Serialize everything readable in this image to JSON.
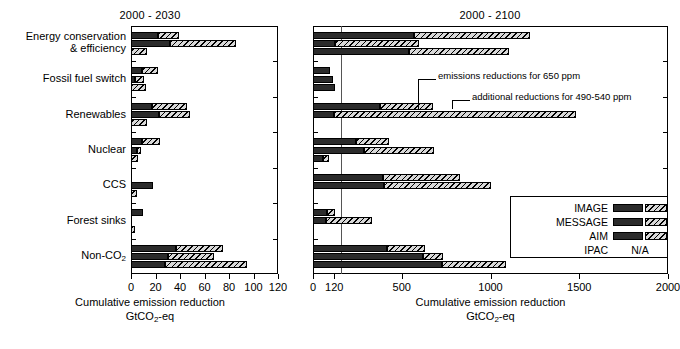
{
  "chart_data": {
    "type": "bar",
    "orientation": "horizontal",
    "title": "",
    "categories": [
      "Energy conservation & efficiency",
      "Fossil fuel switch",
      "Renewables",
      "Nuclear",
      "CCS",
      "Forest sinks",
      "Non-CO2"
    ],
    "legend_entries": [
      "IMAGE",
      "MESSAGE",
      "AIM",
      "IPAC"
    ],
    "legend_position": "bottom-right of right panel",
    "legend_na_text": "N/A",
    "segment_meaning": {
      "solid": "emissions reductions for 650 ppm",
      "hatched": "additional reductions for 490-540 ppm"
    },
    "xlabel": "Cumulative emission reduction GtCO2-eq",
    "ylabel": "",
    "grid": false,
    "panels": [
      {
        "title": "2000 - 2030",
        "xlim": [
          0,
          120
        ],
        "xticks": [
          0,
          20,
          40,
          60,
          80,
          100,
          120
        ],
        "reference_line": null,
        "series": [
          {
            "name": "IMAGE",
            "base": [
              22,
              9,
              17,
              9,
              0,
              10,
              37
            ],
            "additional": [
              [
                22,
                39
              ],
              [
                9,
                22
              ],
              [
                17,
                46
              ],
              [
                9,
                24
              ],
              [
                0,
                0
              ],
              [
                10,
                10
              ],
              [
                37,
                75
              ]
            ]
          },
          {
            "name": "MESSAGE",
            "base": [
              32,
              3,
              23,
              5,
              18,
              0,
              30
            ],
            "additional": [
              [
                32,
                86
              ],
              [
                3,
                11
              ],
              [
                23,
                48
              ],
              [
                5,
                8
              ],
              [
                18,
                18
              ],
              [
                0,
                0
              ],
              [
                30,
                68
              ]
            ]
          },
          {
            "name": "AIM",
            "base": [
              0,
              0,
              0,
              0,
              0,
              0,
              28
            ],
            "additional": [
              [
                0,
                13
              ],
              [
                0,
                12
              ],
              [
                0,
                13
              ],
              [
                0,
                6
              ],
              [
                0,
                5
              ],
              [
                0,
                3
              ],
              [
                28,
                95
              ]
            ]
          }
        ]
      },
      {
        "title": "2000 - 2100",
        "xlim": [
          0,
          2000
        ],
        "xticks": [
          0,
          120,
          500,
          1000,
          1500,
          2000
        ],
        "reference_line": 120,
        "series": [
          {
            "name": "IMAGE",
            "base": [
              570,
              95,
              380,
              245,
              395,
              80,
              415
            ],
            "additional": [
              [
                570,
                1225
              ],
              [
                95,
                95
              ],
              [
                380,
                675
              ],
              [
                245,
                430
              ],
              [
                395,
                830
              ],
              [
                80,
                125
              ],
              [
                415,
                630
              ]
            ]
          },
          {
            "name": "MESSAGE",
            "base": [
              125,
              110,
              120,
              285,
              400,
              75,
              620
            ],
            "additional": [
              [
                125,
                595
              ],
              [
                110,
                110
              ],
              [
                120,
                1480
              ],
              [
                285,
                680
              ],
              [
                400,
                1000
              ],
              [
                75,
                330
              ],
              [
                620,
                730
              ]
            ]
          },
          {
            "name": "AIM",
            "base": [
              540,
              125,
              0,
              55,
              0,
              0,
              725
            ],
            "additional": [
              [
                540,
                1105
              ],
              [
                125,
                125
              ],
              [
                0,
                0
              ],
              [
                55,
                90
              ],
              [
                0,
                0
              ],
              [
                0,
                0
              ],
              [
                725,
                1090
              ]
            ]
          }
        ]
      }
    ],
    "annotations": [
      {
        "text": "emissions reductions for 650 ppm",
        "panel": 1
      },
      {
        "text": "additional reductions for 490-540 ppm",
        "panel": 1
      }
    ]
  },
  "left_panel": {
    "title": "2000 - 2030",
    "xticks": [
      "0",
      "20",
      "40",
      "60",
      "80",
      "100",
      "120"
    ],
    "axis_title_line1": "Cumulative emission reduction",
    "axis_title_line2_pre": "GtCO",
    "axis_title_line2_sub": "2",
    "axis_title_line2_post": "-eq"
  },
  "right_panel": {
    "title": "2000 - 2100",
    "xticks": [
      "0",
      "120",
      "500",
      "1000",
      "1500",
      "2000"
    ],
    "axis_title_line1": "Cumulative emission reduction",
    "axis_title_line2_pre": "GtCO",
    "axis_title_line2_sub": "2",
    "axis_title_line2_post": "-eq",
    "annotation_650": "emissions reductions for 650 ppm",
    "annotation_490": "additional reductions for 490-540 ppm"
  },
  "categories": [
    {
      "line1": "Energy conservation",
      "line2": "& efficiency"
    },
    {
      "line1": "Fossil fuel switch",
      "line2": ""
    },
    {
      "line1": "Renewables",
      "line2": ""
    },
    {
      "line1": "Nuclear",
      "line2": ""
    },
    {
      "line1": "CCS",
      "line2": ""
    },
    {
      "line1": "Forest sinks",
      "line2": ""
    },
    {
      "line1": "Non-CO",
      "line2": "",
      "sub": "2"
    }
  ],
  "legend": {
    "rows": [
      {
        "name": "IMAGE",
        "na": false
      },
      {
        "name": "MESSAGE",
        "na": false
      },
      {
        "name": "AIM",
        "na": false
      },
      {
        "name": "IPAC",
        "na": true,
        "na_text": "N/A"
      }
    ]
  },
  "colors": {
    "solid": "#2b2b2b",
    "hatch_bg": "#d8d8d8",
    "axis": "#000000",
    "refline": "#555555"
  }
}
